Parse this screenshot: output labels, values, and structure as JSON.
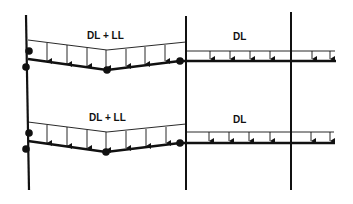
{
  "diagram": {
    "title": "",
    "labels": {
      "upper_left_bay": "DL + LL",
      "upper_right_bay": "DL",
      "lower_left_bay": "DL + LL",
      "lower_right_bay": "DL"
    },
    "colors": {
      "stroke": "#111111",
      "background": "#ffffff"
    }
  }
}
